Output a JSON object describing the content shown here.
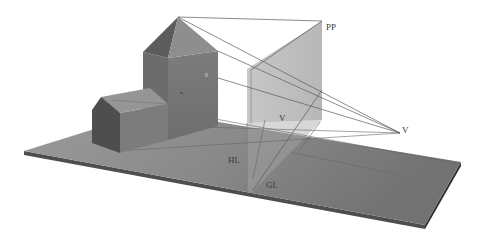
{
  "diagram": {
    "type": "linear-perspective-illustration",
    "labels": {
      "picture_plane": "PP",
      "vanishing_point_left": "V",
      "vanishing_point_right": "V",
      "horizon_line": "HL",
      "ground_line": "GL"
    },
    "objects": [
      {
        "name": "ground-plane",
        "kind": "slab"
      },
      {
        "name": "tower",
        "kind": "square tower with pyramidal roof"
      },
      {
        "name": "house",
        "kind": "gabled house"
      },
      {
        "name": "picture-plane",
        "kind": "translucent vertical plane"
      },
      {
        "name": "sight-lines",
        "kind": "projection lines from tower to station point"
      }
    ],
    "colors": {
      "background": "#ffffff",
      "ground_top": "#8c8c8c",
      "ground_edge": "#4a4a4a",
      "picture_plane": "#b4b4b4",
      "tower_front": "#7a7a7a",
      "tower_side": "#6a6a6a",
      "roof_light": "#8e8e8e",
      "roof_dark": "#5e5e5e",
      "lines": "#555555",
      "label_text": "#3a3a3a"
    }
  }
}
